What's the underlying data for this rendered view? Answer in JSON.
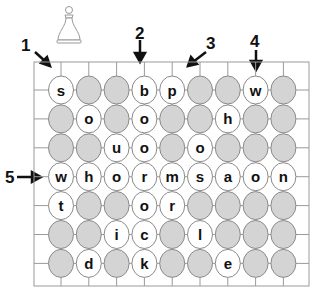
{
  "puzzle": {
    "piece": "pawn-icon",
    "columns": 9,
    "rows": 7,
    "grid": [
      [
        "s",
        "",
        "",
        "b",
        "p",
        "",
        "",
        "w",
        ""
      ],
      [
        "",
        "o",
        "",
        "o",
        "",
        "",
        "h",
        "",
        ""
      ],
      [
        "",
        "",
        "u",
        "o",
        "",
        "o",
        "",
        "",
        ""
      ],
      [
        "w",
        "h",
        "o",
        "r",
        "m",
        "s",
        "a",
        "o",
        "n"
      ],
      [
        "t",
        "",
        "",
        "o",
        "r",
        "",
        "",
        "",
        ""
      ],
      [
        "",
        "",
        "i",
        "c",
        "",
        "l",
        "",
        "",
        ""
      ],
      [
        "",
        "d",
        "",
        "k",
        "",
        "",
        "e",
        "",
        ""
      ]
    ],
    "arrows": [
      {
        "label": "1",
        "direction": "diagonal-down-right",
        "target": "row1-col1"
      },
      {
        "label": "2",
        "direction": "down",
        "target": "col4"
      },
      {
        "label": "3",
        "direction": "diagonal-down-left",
        "target": "row1-col5"
      },
      {
        "label": "4",
        "direction": "down",
        "target": "col8"
      },
      {
        "label": "5",
        "direction": "right",
        "target": "row4"
      }
    ]
  },
  "colors": {
    "filled_cell": "#d4d4d4",
    "empty_cell": "#ffffff",
    "grid_line": "#9a9a9a",
    "text": "#111111"
  }
}
